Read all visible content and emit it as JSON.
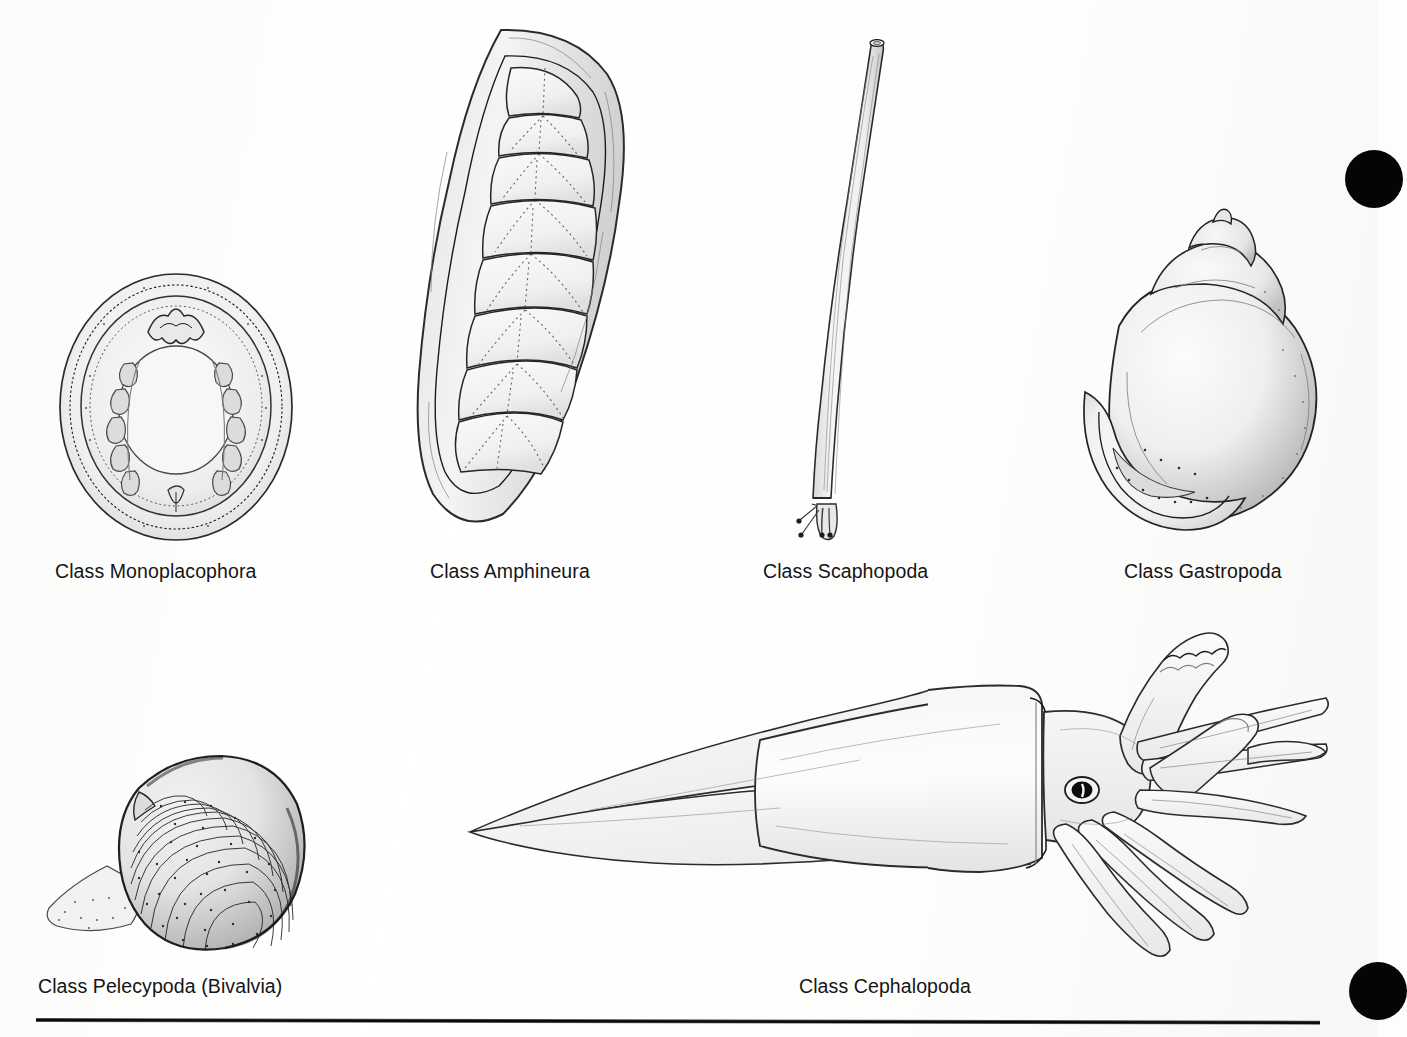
{
  "page": {
    "background_color": "#fdfdfc",
    "ink_color": "#1b1b1b",
    "rule_color": "#0a0a0a",
    "punch_mark_color": "#050505"
  },
  "figures": [
    {
      "id": "monoplacophora",
      "label": "Class Monoplacophora",
      "description": "ventral view of oval monoplacophoran showing mantle rings, paired gills and foot",
      "row": 1,
      "column": 1
    },
    {
      "id": "amphineura",
      "label": "Class Amphineura",
      "description": "dorsal view of chiton with eight overlapping shell plates surrounded by a girdle",
      "row": 1,
      "column": 2
    },
    {
      "id": "scaphopoda",
      "label": "Class Scaphopoda",
      "description": "curved tusk shell with foot and thread-like captacula emerging at the wide end",
      "row": 1,
      "column": 3
    },
    {
      "id": "gastropoda",
      "label": "Class Gastropoda",
      "description": "coiled snail shell with pointed apex above and rounded aperture at lower left",
      "row": 1,
      "column": 4
    },
    {
      "id": "pelecypoda",
      "label": "Class Pelecypoda (Bivalvia)",
      "description": "clam valve with concentric growth lines, umbo at upper left and protruding foot",
      "row": 2,
      "column": 1
    },
    {
      "id": "cephalopoda",
      "label": "Class Cephalopoda",
      "description": "squid in lateral view with pointed tail fins, mantle, eye, eight arms and two long tentacles",
      "row": 2,
      "column": 2
    }
  ],
  "marks": {
    "punch_top": "registration-mark",
    "punch_bottom": "registration-mark",
    "footer_rule": "horizontal-rule"
  }
}
